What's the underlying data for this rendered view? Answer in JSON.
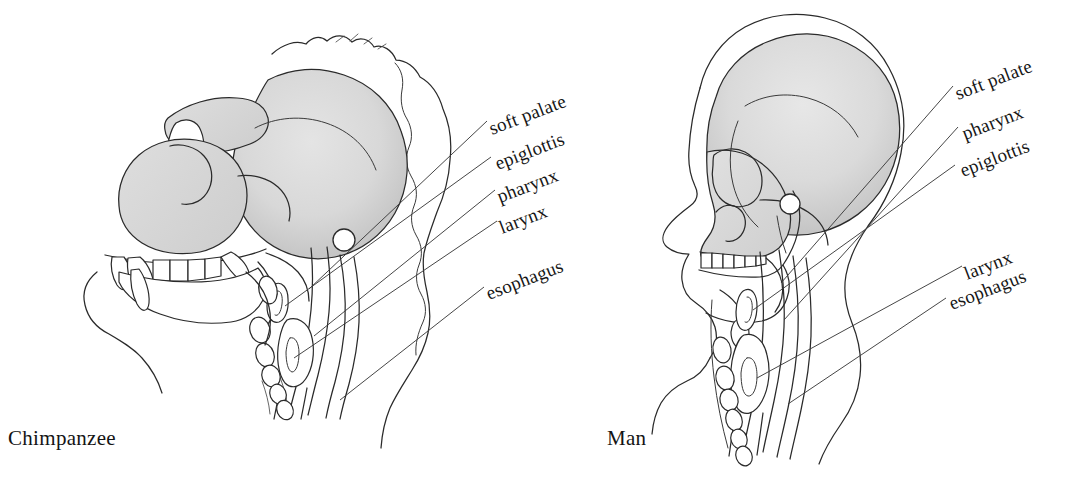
{
  "figure": {
    "background_color": "#ffffff",
    "ink_color": "#2a2a2a",
    "bone_shade_light": "#e9e9e9",
    "bone_shade_mid": "#d6d6d6",
    "bone_shade_dark": "#c2c2c2"
  },
  "panels": [
    {
      "id": "chimpanzee",
      "caption": "Chimpanzee",
      "caption_position": {
        "x": 8,
        "y": 445
      },
      "labels": [
        {
          "name": "soft-palate",
          "text": "soft palate",
          "x": 492,
          "y": 135,
          "rotate": -21
        },
        {
          "name": "epiglottis",
          "text": "epiglottis",
          "x": 498,
          "y": 170,
          "rotate": -21
        },
        {
          "name": "pharynx",
          "text": "pharynx",
          "x": 500,
          "y": 203,
          "rotate": -21
        },
        {
          "name": "larynx",
          "text": "larynx",
          "x": 502,
          "y": 234,
          "rotate": -21
        },
        {
          "name": "esophagus",
          "text": "esophagus",
          "x": 489,
          "y": 300,
          "rotate": -21
        }
      ]
    },
    {
      "id": "man",
      "caption": "Man",
      "caption_position": {
        "x": 607,
        "y": 445
      },
      "labels": [
        {
          "name": "soft-palate",
          "text": "soft palate",
          "x": 958,
          "y": 100,
          "rotate": -21
        },
        {
          "name": "pharynx",
          "text": "pharynx",
          "x": 965,
          "y": 140,
          "rotate": -21
        },
        {
          "name": "epiglottis",
          "text": "epiglottis",
          "x": 963,
          "y": 177,
          "rotate": -21
        },
        {
          "name": "larynx",
          "text": "larynx",
          "x": 967,
          "y": 280,
          "rotate": -21
        },
        {
          "name": "esophagus",
          "text": "esophagus",
          "x": 952,
          "y": 310,
          "rotate": -21
        }
      ]
    }
  ],
  "anatomy_terms": [
    "soft palate",
    "pharynx",
    "epiglottis",
    "larynx",
    "esophagus"
  ]
}
